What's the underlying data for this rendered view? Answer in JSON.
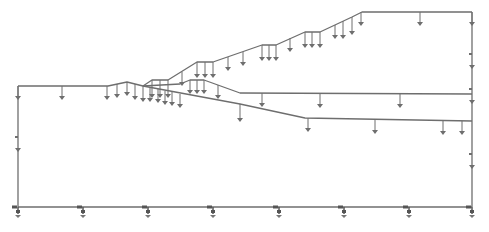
{
  "diagram": {
    "type": "slope-model-with-loads",
    "stroke_color": "#6e6e6e",
    "background": "#ffffff",
    "boundaries": [
      {
        "name": "ground-surface",
        "points": [
          [
            18,
            86
          ],
          [
            108,
            86
          ],
          [
            127,
            82
          ],
          [
            143,
            86
          ],
          [
            152,
            80
          ],
          [
            168,
            80
          ],
          [
            197,
            62
          ],
          [
            213,
            62
          ],
          [
            262,
            45
          ],
          [
            276,
            45
          ],
          [
            305,
            32
          ],
          [
            320,
            32
          ],
          [
            352,
            17
          ],
          [
            362,
            12
          ],
          [
            472,
            12
          ]
        ]
      },
      {
        "name": "layer-boundary-1",
        "points": [
          [
            143,
            86
          ],
          [
            180,
            84
          ],
          [
            190,
            80
          ],
          [
            204,
            80
          ],
          [
            240,
            93
          ],
          [
            472,
            94
          ]
        ]
      },
      {
        "name": "layer-boundary-2",
        "points": [
          [
            143,
            86
          ],
          [
            240,
            104
          ],
          [
            305,
            118
          ],
          [
            472,
            121
          ]
        ]
      },
      {
        "name": "left-boundary",
        "points": [
          [
            18,
            86
          ],
          [
            18,
            207
          ]
        ]
      },
      {
        "name": "right-boundary",
        "points": [
          [
            472,
            12
          ],
          [
            472,
            207
          ]
        ]
      },
      {
        "name": "base-boundary",
        "points": [
          [
            18,
            207
          ],
          [
            472,
            207
          ]
        ]
      }
    ],
    "surface_loads": [
      {
        "x": 18,
        "y": 86,
        "len": 10
      },
      {
        "x": 62,
        "y": 86,
        "len": 10
      },
      {
        "x": 107,
        "y": 86,
        "len": 10
      },
      {
        "x": 117,
        "y": 84,
        "len": 10
      },
      {
        "x": 127,
        "y": 82,
        "len": 10
      },
      {
        "x": 135,
        "y": 84,
        "len": 12
      },
      {
        "x": 143,
        "y": 86,
        "len": 12
      },
      {
        "x": 152,
        "y": 80,
        "len": 14
      },
      {
        "x": 160,
        "y": 80,
        "len": 14
      },
      {
        "x": 168,
        "y": 80,
        "len": 14
      },
      {
        "x": 182,
        "y": 72,
        "len": 10
      },
      {
        "x": 197,
        "y": 62,
        "len": 12
      },
      {
        "x": 205,
        "y": 62,
        "len": 12
      },
      {
        "x": 213,
        "y": 62,
        "len": 12
      },
      {
        "x": 228,
        "y": 57,
        "len": 10
      },
      {
        "x": 243,
        "y": 52,
        "len": 10
      },
      {
        "x": 262,
        "y": 45,
        "len": 12
      },
      {
        "x": 269,
        "y": 45,
        "len": 12
      },
      {
        "x": 276,
        "y": 45,
        "len": 12
      },
      {
        "x": 290,
        "y": 38,
        "len": 10
      },
      {
        "x": 305,
        "y": 32,
        "len": 12
      },
      {
        "x": 312,
        "y": 32,
        "len": 12
      },
      {
        "x": 320,
        "y": 32,
        "len": 12
      },
      {
        "x": 335,
        "y": 25,
        "len": 10
      },
      {
        "x": 343,
        "y": 21,
        "len": 14
      },
      {
        "x": 352,
        "y": 17,
        "len": 14
      },
      {
        "x": 361,
        "y": 12,
        "len": 10
      },
      {
        "x": 420,
        "y": 12,
        "len": 10
      },
      {
        "x": 472,
        "y": 12,
        "len": 10
      }
    ],
    "interface_loads": [
      {
        "x": 150,
        "y": 88,
        "len": 10
      },
      {
        "x": 158,
        "y": 89,
        "len": 10
      },
      {
        "x": 165,
        "y": 91,
        "len": 10
      },
      {
        "x": 172,
        "y": 92,
        "len": 10
      },
      {
        "x": 180,
        "y": 94,
        "len": 10
      },
      {
        "x": 190,
        "y": 80,
        "len": 10
      },
      {
        "x": 197,
        "y": 80,
        "len": 10
      },
      {
        "x": 204,
        "y": 80,
        "len": 10
      },
      {
        "x": 218,
        "y": 85,
        "len": 10
      },
      {
        "x": 240,
        "y": 104,
        "len": 14
      },
      {
        "x": 262,
        "y": 93,
        "len": 10
      },
      {
        "x": 320,
        "y": 94,
        "len": 10
      },
      {
        "x": 400,
        "y": 94,
        "len": 10
      },
      {
        "x": 308,
        "y": 118,
        "len": 10
      },
      {
        "x": 375,
        "y": 120,
        "len": 10
      },
      {
        "x": 443,
        "y": 121,
        "len": 10
      },
      {
        "x": 462,
        "y": 121,
        "len": 10
      }
    ],
    "boundary_markers": [
      {
        "x": 18,
        "y": 148
      },
      {
        "x": 472,
        "y": 65
      },
      {
        "x": 472,
        "y": 100
      },
      {
        "x": 472,
        "y": 165
      }
    ],
    "base_supports": [
      {
        "x": 18,
        "y": 207
      },
      {
        "x": 83,
        "y": 207
      },
      {
        "x": 148,
        "y": 207
      },
      {
        "x": 213,
        "y": 207
      },
      {
        "x": 279,
        "y": 207
      },
      {
        "x": 344,
        "y": 207
      },
      {
        "x": 409,
        "y": 207
      },
      {
        "x": 472,
        "y": 207
      }
    ]
  }
}
